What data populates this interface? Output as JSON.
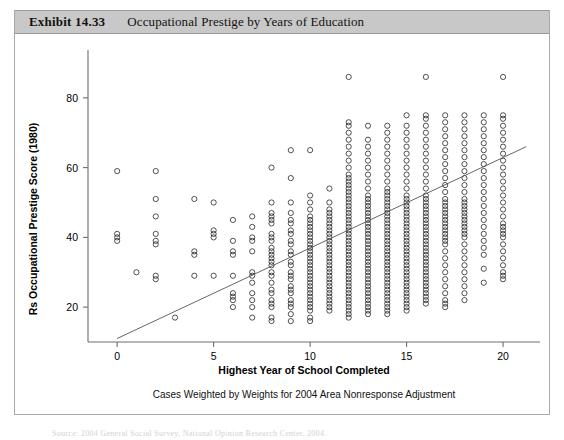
{
  "exhibit": {
    "number": "Exhibit 14.33",
    "title": "Occupational Prestige by Years of Education"
  },
  "source_note": "Source: 2004 General Social Survey, National Opinion Research Center, 2004.",
  "chart_data": {
    "type": "scatter",
    "title": "Occupational Prestige by Years of Education",
    "subcaption": "Cases Weighted by Weights for 2004 Area Nonresponse Adjustment",
    "xlabel": "Highest Year of School Completed",
    "ylabel": "Rs Occupational Prestige Score (1980)",
    "xlim": [
      -1.2,
      21.5
    ],
    "ylim": [
      10,
      92
    ],
    "xticks": [
      0,
      5,
      10,
      15,
      20
    ],
    "yticks": [
      20,
      40,
      60,
      80
    ],
    "grid": false,
    "legend": null,
    "marker": "open-circle",
    "fit_line": {
      "type": "linear-regression",
      "x0": 0,
      "y0": 11,
      "x1": 21.2,
      "y1": 66
    },
    "columns": [
      {
        "x": 0,
        "y": [
          59,
          41,
          40,
          39
        ]
      },
      {
        "x": 1,
        "y": [
          30
        ]
      },
      {
        "x": 2,
        "y": [
          59,
          51,
          46,
          41,
          39,
          38,
          29,
          28
        ]
      },
      {
        "x": 3,
        "y": [
          17
        ]
      },
      {
        "x": 4,
        "y": [
          51,
          36,
          35,
          29
        ]
      },
      {
        "x": 5,
        "y": [
          50,
          42,
          41,
          40,
          29
        ]
      },
      {
        "x": 6,
        "y": [
          45,
          39,
          36,
          35,
          29,
          24,
          23,
          22,
          20
        ]
      },
      {
        "x": 7,
        "y": [
          46,
          43,
          40,
          39,
          36,
          30,
          29,
          27,
          24,
          22,
          20,
          17
        ]
      },
      {
        "x": 8,
        "y": [
          60,
          50,
          47,
          46,
          45,
          44,
          41,
          40,
          39,
          37,
          36,
          35,
          34,
          33,
          32,
          30,
          29,
          27,
          25,
          24,
          22,
          21,
          20,
          17,
          16
        ]
      },
      {
        "x": 9,
        "y": [
          65,
          57,
          50,
          47,
          45,
          44,
          42,
          41,
          39,
          38,
          36,
          35,
          33,
          32,
          30,
          29,
          28,
          26,
          25,
          24,
          22,
          21,
          20,
          18,
          16
        ]
      },
      {
        "x": 10,
        "y": [
          65,
          52,
          50,
          48,
          46,
          45,
          44,
          43,
          42,
          41,
          40,
          39,
          38,
          37,
          36,
          35,
          34,
          33,
          32,
          31,
          30,
          29,
          28,
          27,
          26,
          25,
          24,
          23,
          22,
          21,
          20,
          19,
          17,
          16
        ]
      },
      {
        "x": 11,
        "y": [
          54,
          50,
          48,
          47,
          46,
          45,
          44,
          43,
          42,
          41,
          40,
          39,
          38,
          37,
          36,
          35,
          34,
          33,
          32,
          31,
          30,
          29,
          28,
          27,
          26,
          25,
          24,
          23,
          22,
          21,
          20,
          19
        ]
      },
      {
        "x": 12,
        "y": [
          86,
          73,
          72,
          70,
          68,
          66,
          64,
          62,
          60,
          58,
          57,
          56,
          55,
          54,
          53,
          52,
          51,
          50,
          49,
          48,
          47,
          46,
          45,
          44,
          43,
          42,
          41,
          40,
          39,
          38,
          37,
          36,
          35,
          34,
          33,
          32,
          31,
          30,
          29,
          28,
          27,
          26,
          25,
          24,
          23,
          22,
          21,
          20,
          19,
          18,
          17
        ]
      },
      {
        "x": 13,
        "y": [
          72,
          68,
          66,
          64,
          62,
          60,
          58,
          56,
          54,
          52,
          51,
          50,
          49,
          48,
          47,
          46,
          45,
          44,
          43,
          42,
          41,
          40,
          39,
          38,
          37,
          36,
          35,
          34,
          33,
          32,
          31,
          30,
          29,
          28,
          27,
          26,
          25,
          24,
          23,
          22,
          21,
          20,
          19,
          18
        ]
      },
      {
        "x": 14,
        "y": [
          72,
          70,
          68,
          66,
          64,
          62,
          60,
          58,
          56,
          54,
          53,
          52,
          51,
          50,
          49,
          48,
          47,
          46,
          45,
          44,
          43,
          42,
          41,
          40,
          39,
          38,
          37,
          36,
          35,
          34,
          33,
          32,
          31,
          30,
          29,
          28,
          27,
          26,
          25,
          24,
          23,
          22,
          21,
          20,
          19,
          18
        ]
      },
      {
        "x": 15,
        "y": [
          75,
          72,
          70,
          68,
          66,
          64,
          62,
          60,
          58,
          56,
          54,
          52,
          51,
          50,
          49,
          48,
          47,
          46,
          45,
          44,
          43,
          42,
          41,
          40,
          39,
          38,
          37,
          36,
          35,
          34,
          33,
          32,
          31,
          30,
          29,
          28,
          27,
          26,
          25,
          24,
          23,
          22,
          21,
          20,
          19
        ]
      },
      {
        "x": 16,
        "y": [
          86,
          75,
          74,
          72,
          70,
          68,
          66,
          64,
          62,
          60,
          58,
          56,
          54,
          52,
          51,
          50,
          49,
          48,
          47,
          46,
          45,
          44,
          43,
          42,
          41,
          40,
          39,
          38,
          37,
          36,
          35,
          34,
          33,
          32,
          31,
          30,
          29,
          28,
          27,
          26,
          25,
          24,
          23,
          22,
          21
        ]
      },
      {
        "x": 17,
        "y": [
          75,
          73,
          71,
          69,
          67,
          65,
          63,
          61,
          59,
          57,
          55,
          53,
          51,
          50,
          49,
          48,
          47,
          46,
          45,
          44,
          43,
          42,
          41,
          40,
          39,
          38,
          36,
          34,
          32,
          30,
          28,
          26,
          24,
          22,
          21,
          20
        ]
      },
      {
        "x": 18,
        "y": [
          75,
          73,
          71,
          69,
          67,
          65,
          63,
          61,
          59,
          57,
          55,
          53,
          51,
          50,
          49,
          48,
          47,
          46,
          45,
          44,
          43,
          42,
          41,
          40,
          38,
          36,
          34,
          32,
          30,
          28,
          26,
          24,
          22
        ]
      },
      {
        "x": 19,
        "y": [
          75,
          73,
          71,
          69,
          67,
          65,
          63,
          61,
          59,
          57,
          55,
          53,
          51,
          49,
          47,
          45,
          43,
          41,
          39,
          37,
          35,
          31,
          27
        ]
      },
      {
        "x": 20,
        "y": [
          86,
          75,
          74,
          72,
          70,
          68,
          66,
          64,
          62,
          60,
          58,
          56,
          54,
          52,
          50,
          48,
          46,
          44,
          43,
          42,
          41,
          40,
          38,
          36,
          34,
          32,
          30,
          29,
          28
        ]
      }
    ]
  }
}
